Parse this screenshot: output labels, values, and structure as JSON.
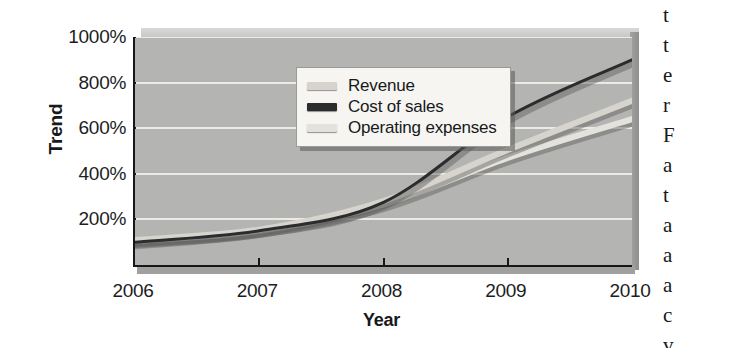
{
  "chart_data": {
    "type": "line",
    "title": "",
    "xlabel": "Year",
    "ylabel": "Trend",
    "categories": [
      "2006",
      "2007",
      "2008",
      "2009",
      "2010"
    ],
    "x": [
      2006,
      2007,
      2008,
      2009,
      2010
    ],
    "ylim": [
      0,
      1000
    ],
    "xlim": [
      2006,
      2010
    ],
    "yticks": [
      200,
      400,
      600,
      800,
      1000
    ],
    "ytick_labels": [
      "200%",
      "400%",
      "600%",
      "800%",
      "1000%"
    ],
    "grid": true,
    "legend_position": "top-left inside plot",
    "series": [
      {
        "name": "Revenue",
        "color": "#d6d4cd",
        "values": [
          110,
          155,
          280,
          505,
          720
        ]
      },
      {
        "name": "Cost of sales",
        "color": "#2a2c2e",
        "values": [
          100,
          150,
          275,
          650,
          900
        ]
      },
      {
        "name": "Operating expenses",
        "color": "#e4e2dc",
        "values": [
          105,
          150,
          265,
          470,
          640
        ]
      }
    ]
  },
  "axes": {
    "y_title": "Trend",
    "x_title": "Year"
  },
  "legend": {
    "entries": [
      {
        "label": "Revenue",
        "color": "#d6d4cd"
      },
      {
        "label": "Cost of sales",
        "color": "#2a2c2e"
      },
      {
        "label": "Operating expenses",
        "color": "#e4e2dc"
      }
    ]
  },
  "side_text": {
    "lines": [
      "t",
      "t",
      "e",
      "r",
      "F",
      "a",
      "t",
      "a",
      "a",
      "a",
      "c",
      "v"
    ]
  },
  "colors": {
    "plot_background": "#b4b4b2",
    "gridline": "#eceae4",
    "axis": "#15171a",
    "page_background": "#ffffff"
  }
}
